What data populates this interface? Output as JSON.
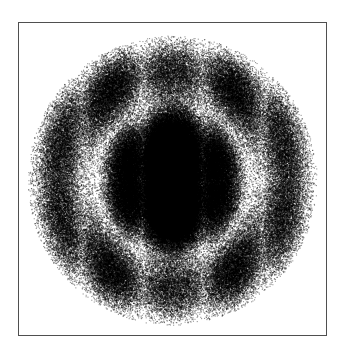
{
  "figure": {
    "title": "",
    "caption": "Monte Carlo sampled electron probability density",
    "width": 343,
    "height": 357,
    "background_color": "#ffffff"
  },
  "frame": {
    "name": "plot-frame",
    "x": 18,
    "y": 22,
    "width": 309,
    "height": 314,
    "border_color": "#4f4f4f",
    "border_width": 1,
    "fill_color": "#ffffff"
  },
  "chart_data": {
    "type": "scatter",
    "title": "",
    "subtitle": "",
    "xlabel": "",
    "ylabel": "",
    "xlim": [
      -1,
      1
    ],
    "ylim": [
      -1,
      1
    ],
    "grid": false,
    "legend": null,
    "tick_labels_x": [],
    "tick_labels_y": [],
    "annotations": [],
    "render_style": "stipple-density",
    "point_count": 260000,
    "point_color": "#000000",
    "point_radius_px": 0.55,
    "density_model": {
      "center_x_px": 172,
      "center_y_px": 180,
      "outer_radius_px": 142,
      "radial_nodes": [
        0.23,
        0.52
      ],
      "angular_lobes": 3,
      "vertical_column_centers_px": [
        112,
        172,
        232
      ],
      "column_half_width_px": 26,
      "bright_nodal_lines_x_px": [
        140,
        205
      ],
      "core_lobe": {
        "center_px": [
          172,
          180
        ],
        "radius_x_px": 22,
        "radius_y_px": 30,
        "darkness": 0.98
      },
      "side_lobes": [
        {
          "center_px": [
            116,
            180
          ],
          "radius_x_px": 19,
          "radius_y_px": 26,
          "darkness": 0.95
        },
        {
          "center_px": [
            228,
            180
          ],
          "radius_x_px": 19,
          "radius_y_px": 26,
          "darkness": 0.95
        }
      ],
      "outer_bands": [
        {
          "center_px": [
            92,
            112
          ],
          "darkness": 0.72
        },
        {
          "center_px": [
            252,
            112
          ],
          "darkness": 0.72
        },
        {
          "center_px": [
            92,
            248
          ],
          "darkness": 0.72
        },
        {
          "center_px": [
            252,
            248
          ],
          "darkness": 0.72
        }
      ],
      "bright_ring_radius_px": 62,
      "extent_px": {
        "left": 32,
        "right": 315,
        "top": 45,
        "bottom": 316
      }
    },
    "series": [
      {
        "name": "electron-density-samples",
        "color": "#000000",
        "values": []
      }
    ]
  }
}
